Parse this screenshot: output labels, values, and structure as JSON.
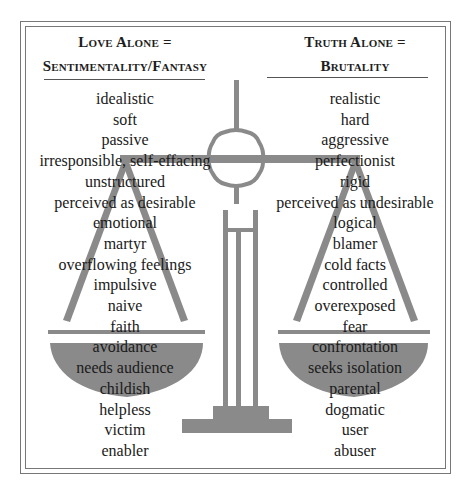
{
  "left": {
    "heading_line1": "Love Alone =",
    "heading_line2": "Sentimentality/Fantasy",
    "items": [
      "idealistic",
      "soft",
      "passive",
      "irresponsible, self-effacing",
      "unstructured",
      "perceived as desirable",
      "emotional",
      "martyr",
      "overflowing feelings",
      "impulsive",
      "naive",
      "faith",
      "avoidance",
      "needs audience",
      "childish",
      "helpless",
      "victim",
      "enabler"
    ]
  },
  "right": {
    "heading_line1": "Truth Alone =",
    "heading_line2": "Brutality",
    "items": [
      "realistic",
      "hard",
      "aggressive",
      "perfectionist",
      "rigid",
      "perceived as undesirable",
      "logical",
      "blamer",
      "cold facts",
      "controlled",
      "overexposed",
      "fear",
      "confrontation",
      "seeks isolation",
      "parental",
      "dogmatic",
      "user",
      "abuser"
    ]
  },
  "colors": {
    "scale_gray": "#8a8a8a",
    "frame_gray": "#777777",
    "text": "#1a1a1a",
    "background": "#ffffff"
  },
  "icons": {
    "scale": "balance-scale-icon"
  }
}
